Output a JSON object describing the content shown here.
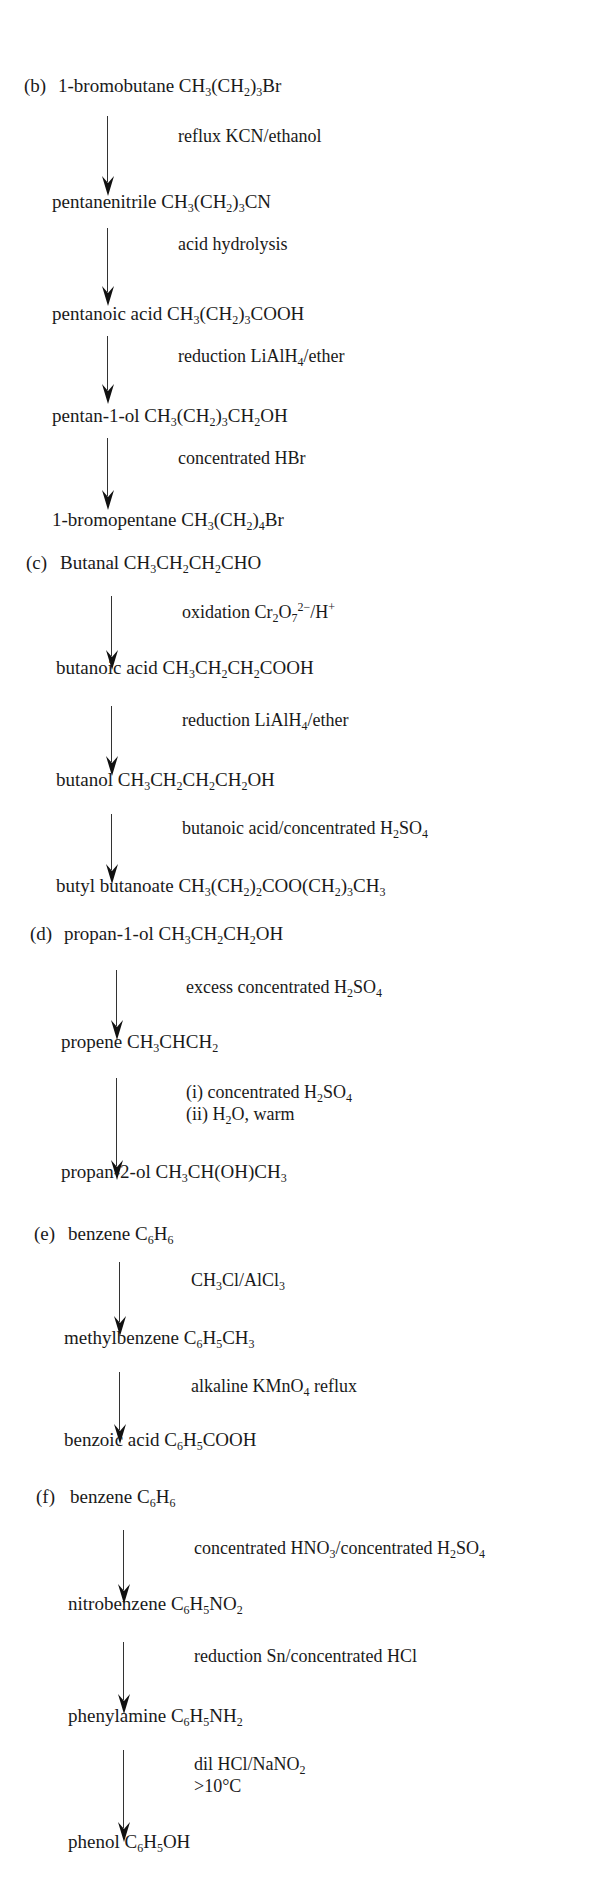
{
  "sections": [
    {
      "label": "(b)",
      "start": {
        "name": "1-bromobutane",
        "formula": "CH<sub>3</sub>(CH<sub>2</sub>)<sub>3</sub>Br"
      },
      "steps": [
        {
          "reagent": "reflux KCN/ethanol",
          "product": {
            "name": "pentanenitrile",
            "formula": "CH<sub>3</sub>(CH<sub>2</sub>)<sub>3</sub>CN"
          }
        },
        {
          "reagent": "acid hydrolysis",
          "product": {
            "name": "pentanoic acid",
            "formula": "CH<sub>3</sub>(CH<sub>2</sub>)<sub>3</sub>COOH"
          }
        },
        {
          "reagent": "reduction LiAlH<sub>4</sub>/ether",
          "product": {
            "name": "pentan-1-ol",
            "formula": "CH<sub>3</sub>(CH<sub>2</sub>)<sub>3</sub>CH<sub>2</sub>OH"
          }
        },
        {
          "reagent": "concentrated HBr",
          "product": {
            "name": "1-bromopentane",
            "formula": "CH<sub>3</sub>(CH<sub>2</sub>)<sub>4</sub>Br"
          }
        }
      ]
    },
    {
      "label": "(c)",
      "start": {
        "name": "Butanal",
        "formula": "CH<sub>3</sub>CH<sub>2</sub>CH<sub>2</sub>CHO"
      },
      "steps": [
        {
          "reagent": "oxidation Cr<sub>2</sub>O<sub>7</sub><sup>2&minus;</sup>/H<sup>+</sup>",
          "product": {
            "name": "butanoic acid",
            "formula": "CH<sub>3</sub>CH<sub>2</sub>CH<sub>2</sub>COOH"
          }
        },
        {
          "reagent": "reduction LiAlH<sub>4</sub>/ether",
          "product": {
            "name": "butanol",
            "formula": "CH<sub>3</sub>CH<sub>2</sub>CH<sub>2</sub>CH<sub>2</sub>OH"
          }
        },
        {
          "reagent": "butanoic acid/concentrated H<sub>2</sub>SO<sub>4</sub>",
          "product": {
            "name": "butyl butanoate",
            "formula": "CH<sub>3</sub>(CH<sub>2</sub>)<sub>2</sub>COO(CH<sub>2</sub>)<sub>3</sub>CH<sub>3</sub>"
          }
        }
      ]
    },
    {
      "label": "(d)",
      "start": {
        "name": "propan-1-ol",
        "formula": "CH<sub>3</sub>CH<sub>2</sub>CH<sub>2</sub>OH"
      },
      "steps": [
        {
          "reagent": "excess concentrated H<sub>2</sub>SO<sub>4</sub>",
          "product": {
            "name": "propene",
            "formula": "CH<sub>3</sub>CHCH<sub>2</sub>"
          }
        },
        {
          "reagent": "(i) concentrated H<sub>2</sub>SO<sub>4</sub><br>(ii) H<sub>2</sub>O, warm",
          "product": {
            "name": "propan-2-ol",
            "formula": "CH<sub>3</sub>CH(OH)CH<sub>3</sub>"
          }
        }
      ]
    },
    {
      "label": "(e)",
      "start": {
        "name": "benzene",
        "formula": "C<sub>6</sub>H<sub>6</sub>"
      },
      "steps": [
        {
          "reagent": "CH<sub>3</sub>Cl/AlCl<sub>3</sub>",
          "product": {
            "name": "methylbenzene",
            "formula": "C<sub>6</sub>H<sub>5</sub>CH<sub>3</sub>"
          }
        },
        {
          "reagent": "alkaline KMnO<sub>4</sub> reflux",
          "product": {
            "name": "benzoic acid",
            "formula": "C<sub>6</sub>H<sub>5</sub>COOH"
          }
        }
      ]
    },
    {
      "label": "(f)",
      "start": {
        "name": "benzene",
        "formula": "C<sub>6</sub>H<sub>6</sub>"
      },
      "steps": [
        {
          "reagent": "concentrated HNO<sub>3</sub>/concentrated H<sub>2</sub>SO<sub>4</sub>",
          "product": {
            "name": "nitrobenzene",
            "formula": "C<sub>6</sub>H<sub>5</sub>NO<sub>2</sub>"
          }
        },
        {
          "reagent": "reduction Sn/concentrated HCl",
          "product": {
            "name": "phenylamine",
            "formula": "C<sub>6</sub>H<sub>5</sub>NH<sub>2</sub>"
          }
        },
        {
          "reagent": "dil HCl/NaNO<sub>2</sub><br>&gt;10&deg;C",
          "product": {
            "name": "phenol",
            "formula": "C<sub>6</sub>H<sub>5</sub>OH"
          }
        }
      ]
    }
  ],
  "layout": [
    {
      "label_x": 24,
      "start_y": 86,
      "arrow_x": 108,
      "reagent_x": 178,
      "step_y": [
        {
          "arrow_top": 116,
          "arrow_bottom": 196,
          "reagent_y": 136,
          "product_y": 202
        },
        {
          "arrow_top": 228,
          "arrow_bottom": 306,
          "reagent_y": 244,
          "product_y": 314
        },
        {
          "arrow_top": 336,
          "arrow_bottom": 404,
          "reagent_y": 356,
          "product_y": 416
        },
        {
          "arrow_top": 438,
          "arrow_bottom": 510,
          "reagent_y": 458,
          "product_y": 520
        }
      ]
    },
    {
      "label_x": 26,
      "start_y": 563,
      "arrow_x": 112,
      "reagent_x": 182,
      "step_y": [
        {
          "arrow_top": 596,
          "arrow_bottom": 670,
          "reagent_y": 612,
          "product_y": 668
        },
        {
          "arrow_top": 706,
          "arrow_bottom": 776,
          "reagent_y": 720,
          "product_y": 780
        },
        {
          "arrow_top": 814,
          "arrow_bottom": 884,
          "reagent_y": 828,
          "product_y": 886
        }
      ]
    },
    {
      "label_x": 30,
      "start_y": 934,
      "arrow_x": 117,
      "reagent_x": 186,
      "step_y": [
        {
          "arrow_top": 970,
          "arrow_bottom": 1040,
          "reagent_y": 987,
          "product_y": 1042
        },
        {
          "arrow_top": 1078,
          "arrow_bottom": 1180,
          "reagent_y": 1092,
          "product_y": 1172
        }
      ]
    },
    {
      "label_x": 34,
      "start_y": 1234,
      "arrow_x": 120,
      "reagent_x": 191,
      "step_y": [
        {
          "arrow_top": 1262,
          "arrow_bottom": 1336,
          "reagent_y": 1280,
          "product_y": 1338
        },
        {
          "arrow_top": 1372,
          "arrow_bottom": 1444,
          "reagent_y": 1386,
          "product_y": 1440
        }
      ]
    },
    {
      "label_x": 36,
      "start_y": 1497,
      "arrow_x": 124,
      "reagent_x": 194,
      "step_y": [
        {
          "arrow_top": 1530,
          "arrow_bottom": 1604,
          "reagent_y": 1548,
          "product_y": 1604
        },
        {
          "arrow_top": 1642,
          "arrow_bottom": 1714,
          "reagent_y": 1656,
          "product_y": 1716
        },
        {
          "arrow_top": 1750,
          "arrow_bottom": 1842,
          "reagent_y": 1764,
          "product_y": 1842
        }
      ]
    }
  ]
}
